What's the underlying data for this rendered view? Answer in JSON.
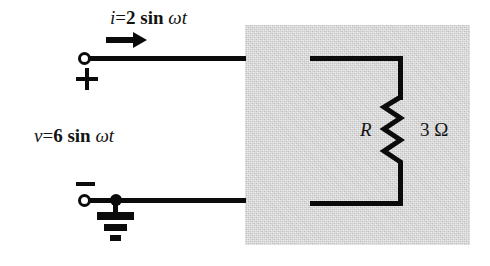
{
  "figure": {
    "type": "electrical-circuit-schematic",
    "background_color": "#ffffff",
    "ink_color": "#0b0b0b"
  },
  "shaded_network": {
    "label": "shaded-network-region",
    "fill_color": "#c9c9c9",
    "bounds": {
      "x": 245,
      "y": 25,
      "width": 225,
      "height": 220
    }
  },
  "source_labels": {
    "current": {
      "symbol": "i",
      "equals": "=",
      "amplitude": "2",
      "function": "sin",
      "argument": "ωt",
      "full_text": "i = 2 sin ωt"
    },
    "voltage": {
      "symbol": "v",
      "equals": "=",
      "amplitude": "6",
      "function": "sin",
      "argument": "ωt",
      "full_text": "v = 6 sin ωt"
    }
  },
  "polarity": {
    "positive": "+",
    "negative": "−"
  },
  "current_arrow": {
    "name": "current-direction-arrow",
    "direction": "right"
  },
  "terminals": {
    "top": {
      "name": "top-terminal",
      "style": "open-circle"
    },
    "bottom": {
      "name": "bottom-terminal",
      "style": "open-circle"
    }
  },
  "ground": {
    "name": "ground-symbol",
    "style": "earth-three-bar"
  },
  "component": {
    "name": "resistor",
    "designator": "R",
    "value": "3",
    "unit": "Ω",
    "value_text": "3 Ω",
    "symbol_style": "zigzag-vertical"
  }
}
